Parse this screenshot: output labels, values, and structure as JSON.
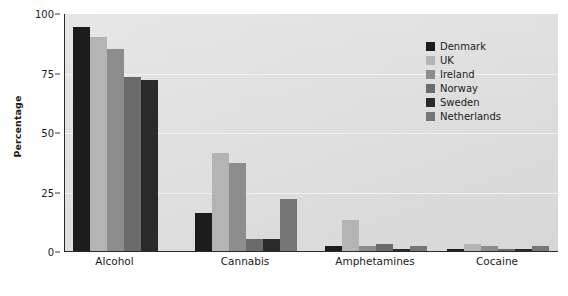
{
  "chart_data": {
    "type": "bar",
    "title": "",
    "subtitle": "",
    "xlabel": "",
    "ylabel": "Percentage",
    "categories": [
      "Alcohol",
      "Cannabis",
      "Amphetamines",
      "Cocaine"
    ],
    "ylim": [
      0,
      100
    ],
    "yticks": [
      0,
      25,
      50,
      75,
      100
    ],
    "ytick_labels": [
      "0",
      "25",
      "50",
      "75",
      "100"
    ],
    "grid": true,
    "legend_position": "top-right",
    "series": [
      {
        "name": "Denmark",
        "color": "#1c1c1c",
        "values": [
          94,
          16,
          2,
          1
        ]
      },
      {
        "name": "UK",
        "color": "#b4b4b4",
        "values": [
          90,
          41,
          13,
          3
        ]
      },
      {
        "name": "Ireland",
        "color": "#8d8d8d",
        "values": [
          85,
          37,
          2,
          2
        ]
      },
      {
        "name": "Norway",
        "color": "#6b6b6b",
        "values": [
          73,
          5,
          3,
          1
        ]
      },
      {
        "name": "Sweden",
        "color": "#2a2a2a",
        "values": [
          72,
          5,
          1,
          1
        ]
      },
      {
        "name": "Netherlands",
        "color": "#767676",
        "values": [
          null,
          22,
          2,
          2
        ]
      }
    ]
  },
  "legend": {
    "items": [
      {
        "label": "Denmark",
        "color": "#1c1c1c"
      },
      {
        "label": "UK",
        "color": "#b4b4b4"
      },
      {
        "label": "Ireland",
        "color": "#8d8d8d"
      },
      {
        "label": "Norway",
        "color": "#6b6b6b"
      },
      {
        "label": "Sweden",
        "color": "#2a2a2a"
      },
      {
        "label": "Netherlands",
        "color": "#767676"
      }
    ]
  },
  "axes": {
    "y_title": "Percentage"
  },
  "colors": {
    "plot_background": "#dfdfdf",
    "page_background": "#ffffff",
    "axis_line": "#2b2b2b",
    "gridline": "#ffffff",
    "text": "#1b1b1b"
  }
}
